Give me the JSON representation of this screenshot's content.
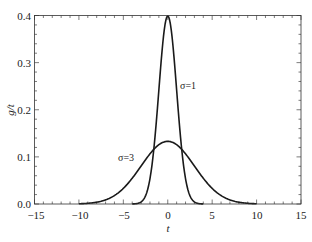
{
  "chart_data": {
    "type": "line",
    "title": "",
    "xlabel": "t",
    "ylabel": "g/t",
    "xlim": [
      -15,
      15
    ],
    "ylim": [
      0.0,
      0.4
    ],
    "grid": false,
    "legend": null,
    "x_ticks": [
      -15,
      -10,
      -5,
      0,
      5,
      10,
      15
    ],
    "x_tick_labels": [
      "−15",
      "−10",
      "−5",
      "0",
      "5",
      "10",
      "15"
    ],
    "y_ticks": [
      0.0,
      0.1,
      0.2,
      0.3,
      0.4
    ],
    "y_tick_labels": [
      "0.0",
      "0.1",
      "0.2",
      "0.3",
      "0.4"
    ],
    "x_minor_step": 1,
    "y_minor_step": 0.02,
    "series": [
      {
        "name": "σ=1",
        "description": "Gaussian, mean 0, sigma 1, drawn for t in [-4, 4]",
        "sigma": 1,
        "mean": 0,
        "t_range": [
          -4,
          4
        ],
        "peak": 0.399,
        "x": [
          -4,
          -3,
          -2,
          -1.5,
          -1,
          -0.5,
          0,
          0.5,
          1,
          1.5,
          2,
          3,
          4
        ],
        "values": [
          0.0001,
          0.0044,
          0.054,
          0.1295,
          0.242,
          0.352,
          0.399,
          0.352,
          0.242,
          0.1295,
          0.054,
          0.0044,
          0.0001
        ]
      },
      {
        "name": "σ=3",
        "description": "Gaussian, mean 0, sigma 3, drawn for t in [-10, 10]",
        "sigma": 3,
        "mean": 0,
        "t_range": [
          -10,
          10
        ],
        "peak": 0.133,
        "x": [
          -10,
          -8,
          -6,
          -4,
          -3,
          -2,
          -1,
          0,
          1,
          2,
          3,
          4,
          6,
          8,
          10
        ],
        "values": [
          0.0005,
          0.0038,
          0.018,
          0.0547,
          0.0807,
          0.1065,
          0.1258,
          0.133,
          0.1258,
          0.1065,
          0.0807,
          0.0547,
          0.018,
          0.0038,
          0.0005
        ]
      }
    ],
    "annotations": [
      {
        "text": "σ=1",
        "x": 1.4,
        "y": 0.225
      },
      {
        "text": "σ=3",
        "x": -4,
        "y": 0.095
      }
    ]
  },
  "labels": {
    "xlabel": "t",
    "ylabel": "g/t",
    "anno_sigma1": "σ=1",
    "anno_sigma3": "σ=3",
    "xt0": "−15",
    "xt1": "−10",
    "xt2": "−5",
    "xt3": "0",
    "xt4": "5",
    "xt5": "10",
    "xt6": "15",
    "yt0": "0.0",
    "yt1": "0.1",
    "yt2": "0.2",
    "yt3": "0.3",
    "yt4": "0.4"
  }
}
